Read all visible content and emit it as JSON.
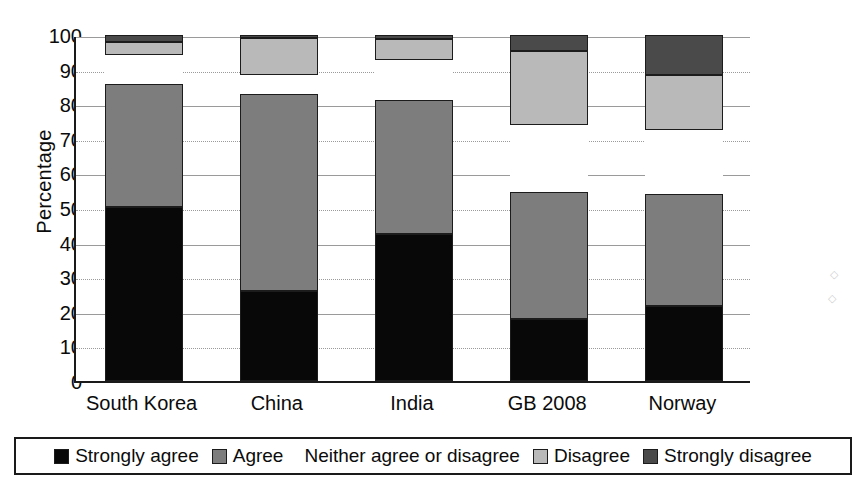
{
  "chart_data": {
    "type": "bar",
    "stacked": true,
    "orientation": "vertical",
    "title": "",
    "xlabel": "",
    "ylabel": "Percentage",
    "ylim": [
      0,
      100
    ],
    "yticks": [
      0,
      10,
      20,
      30,
      40,
      50,
      60,
      70,
      80,
      90,
      100
    ],
    "grid": true,
    "legend_position": "bottom",
    "categories": [
      "South Korea",
      "China",
      "India",
      "GB 2008",
      "Norway"
    ],
    "series": [
      {
        "name": "Strongly agree",
        "color": "#080808",
        "values": [
          50.3,
          26.0,
          42.5,
          18.0,
          21.8
        ]
      },
      {
        "name": "Agree",
        "color": "#7d7d7d",
        "values": [
          35.5,
          57.0,
          38.6,
          36.5,
          32.2
        ]
      },
      {
        "name": "Neither agree or disagree",
        "color": "#ffffff",
        "values": [
          8.5,
          5.5,
          11.6,
          19.4,
          18.5
        ]
      },
      {
        "name": "Disagree",
        "color": "#b9b9b9",
        "values": [
          3.7,
          10.5,
          6.2,
          21.4,
          16.0
        ]
      },
      {
        "name": "Strongly disagree",
        "color": "#4a4a4a",
        "values": [
          2.0,
          1.0,
          1.1,
          4.7,
          11.5
        ]
      }
    ]
  },
  "axis": {
    "y_title": "Percentage",
    "y_tick_labels": [
      "100",
      "90",
      "80",
      "70",
      "60",
      "50",
      "40",
      "30",
      "20",
      "10",
      "0"
    ],
    "x_tick_labels": [
      "South Korea",
      "China",
      "India",
      "GB 2008",
      "Norway"
    ]
  },
  "legend": {
    "items": [
      {
        "label": "Strongly agree",
        "swatch": "black"
      },
      {
        "label": "Agree",
        "swatch": "medium-gray"
      },
      {
        "label": "Neither agree or disagree",
        "swatch": "white"
      },
      {
        "label": "Disagree",
        "swatch": "light-gray"
      },
      {
        "label": "Strongly disagree",
        "swatch": "dark-gray"
      }
    ]
  },
  "colors": {
    "strongly_agree": "#080808",
    "agree": "#7d7d7d",
    "neither": "#ffffff",
    "disagree": "#b9b9b9",
    "strongly_disagree": "#4a4a4a",
    "axis": "#1a1a1a",
    "grid": "#9a9a9a"
  }
}
